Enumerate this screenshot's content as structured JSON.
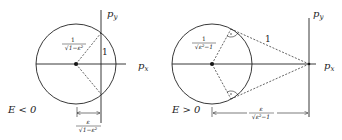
{
  "diagrams": [
    {
      "case_label": "E < 0",
      "axis_x_label": "p",
      "axis_x_sub": "x",
      "axis_y_label": "p",
      "axis_y_sub": "y",
      "radius_label_num": "1",
      "radius_label_den": "√1−ε²",
      "side_label": "1",
      "distance_label_num": "ε",
      "distance_label_den": "√1−ε²"
    },
    {
      "case_label": "E > 0",
      "axis_x_label": "p",
      "axis_x_sub": "x",
      "axis_y_label": "p",
      "axis_y_sub": "y",
      "radius_label_num": "1",
      "radius_label_den": "√ε²−1",
      "side_label": "1",
      "distance_label_num": "ε",
      "distance_label_den": "√ε²−1"
    }
  ],
  "colors": {
    "stroke": "#222222",
    "background": "#ffffff"
  }
}
